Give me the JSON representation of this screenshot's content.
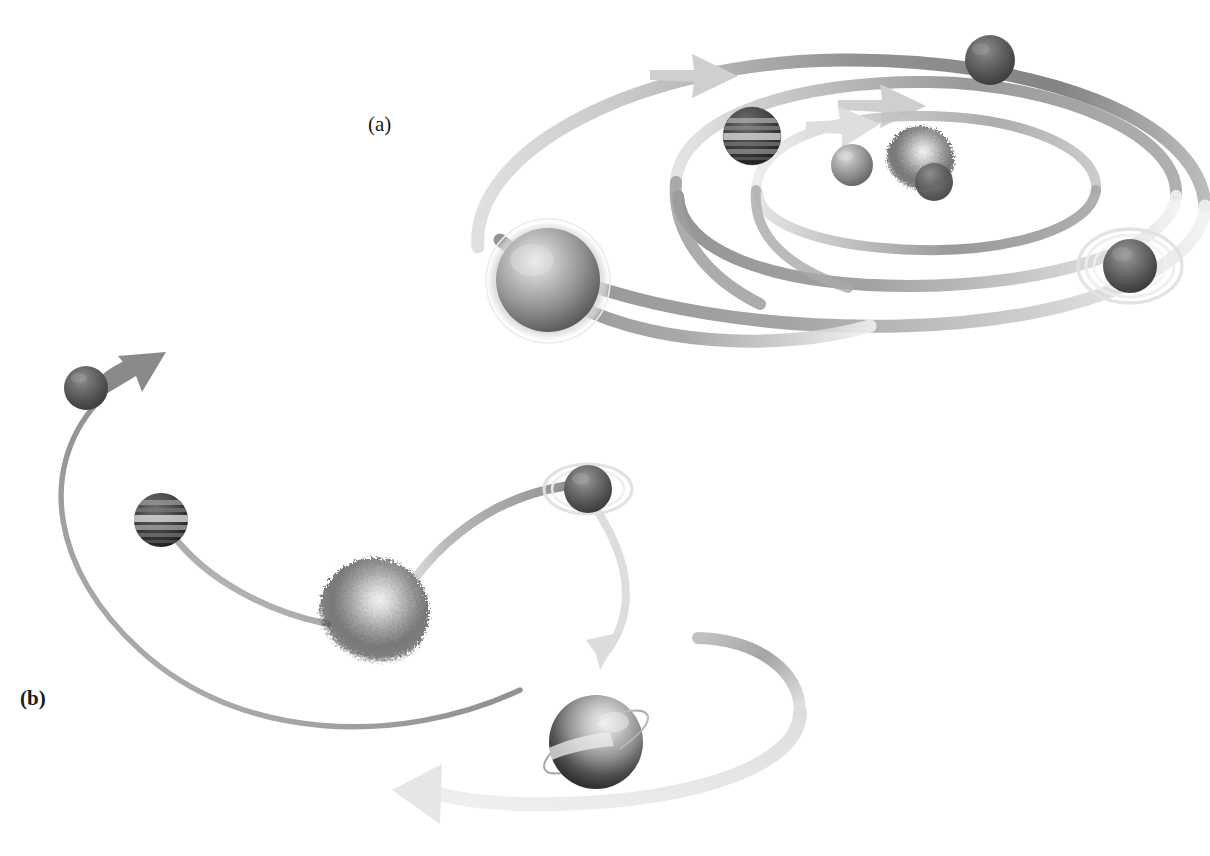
{
  "figure": {
    "background_color": "#ffffff",
    "width": 1210,
    "height": 856,
    "panels": [
      {
        "id": "a",
        "label": "(a)",
        "caption_position": "top-left-of-panel",
        "description": "Coplanar multi-body system: nested elliptical ribbon orbits seen in perspective, all bodies orbiting in the same direction",
        "orbit_count": 3,
        "body_count": 6
      },
      {
        "id": "b",
        "label": "(b)",
        "caption_position": "left-of-panel",
        "description": "Scattered system: bodies on independent open curved trajectories around a diffuse central object",
        "orbit_count": 4,
        "body_count": 4
      }
    ]
  },
  "colors": {
    "background": "#ffffff",
    "orbit_dark": "#7a7a7a",
    "orbit_mid": "#9b9b9b",
    "orbit_light": "#cfcfcf",
    "orbit_pale": "#e6e6e6",
    "arrow_light": "#d4d4d4",
    "arrow_mid": "#a8a8a8",
    "sphere_light": "#d8d8d8",
    "sphere_mid": "#8e8e8e",
    "sphere_dark": "#3a3a3a",
    "sphere_deep": "#1f1f1f",
    "ring_halo": "#e8e8e8",
    "label_text": "#1a1a1a"
  },
  "panel_a": {
    "label": "(a)",
    "orbits": [
      {
        "name": "outer-orbit",
        "cx": 835,
        "cy": 190,
        "rx": 372,
        "ry": 136,
        "tilt": -6,
        "band_width": 13,
        "tone": "orbit_mid",
        "arrow": "right"
      },
      {
        "name": "middle-orbit",
        "cx": 880,
        "cy": 178,
        "rx": 255,
        "ry": 96,
        "tilt": -6,
        "band_width": 12,
        "tone": "orbit_mid",
        "arrow": "right"
      },
      {
        "name": "inner-orbit",
        "cx": 905,
        "cy": 170,
        "rx": 158,
        "ry": 62,
        "tilt": -6,
        "band_width": 10,
        "tone": "orbit_light",
        "arrow": "right"
      }
    ],
    "bodies": [
      {
        "name": "large-gray-sphere",
        "kind": "ringed-halo-sphere",
        "cx": 548,
        "cy": 280,
        "r": 52,
        "surface": "smooth-gradient",
        "has_halo": true
      },
      {
        "name": "banded-gas-giant",
        "kind": "banded-planet",
        "cx": 752,
        "cy": 136,
        "r": 29,
        "surface": "horizontal-bands",
        "has_halo": false
      },
      {
        "name": "small-dark-sphere-top-right",
        "kind": "plain-sphere",
        "cx": 990,
        "cy": 60,
        "r": 25,
        "surface": "mottled",
        "has_halo": false
      },
      {
        "name": "small-gray-sphere-inner",
        "kind": "plain-sphere",
        "cx": 852,
        "cy": 165,
        "r": 21,
        "surface": "smooth-gradient",
        "has_halo": false
      },
      {
        "name": "diffuse-nebular-body",
        "kind": "fuzzy-sphere",
        "cx": 920,
        "cy": 162,
        "r": 34,
        "surface": "grainy-cloud",
        "has_halo": false
      },
      {
        "name": "ringed-planet-right",
        "kind": "ringed-planet",
        "cx": 1130,
        "cy": 266,
        "r": 27,
        "surface": "mottled",
        "has_halo": true
      }
    ]
  },
  "panel_b": {
    "label": "(b)",
    "trajectories": [
      {
        "name": "outer-left-arc",
        "tone": "orbit_mid",
        "band_width": 5,
        "arrow": "up-right",
        "description": "long thin arc sweeping from lower right up to upper left body"
      },
      {
        "name": "inner-left-arc",
        "tone": "orbit_mid",
        "band_width": 6,
        "arrow": "none",
        "description": "arc from centre out to banded planet at mid-left"
      },
      {
        "name": "ringed-planet-arc",
        "tone": "orbit_mid",
        "band_width": 9,
        "arrow": "none",
        "description": "arc running to the ringed planet at upper right"
      },
      {
        "name": "lower-right-sweep",
        "tone": "arrow_light",
        "band_width": 14,
        "arrow": "left",
        "description": "pale wide ribbon curving around the lower-right sphere and exiting left"
      }
    ],
    "bodies": [
      {
        "name": "small-sphere-upper-left",
        "kind": "plain-sphere",
        "cx": 86,
        "cy": 388,
        "r": 22,
        "surface": "mottled",
        "has_halo": false
      },
      {
        "name": "banded-gas-giant-left",
        "kind": "banded-planet",
        "cx": 161,
        "cy": 520,
        "r": 27,
        "surface": "horizontal-bands",
        "has_halo": false
      },
      {
        "name": "ringed-planet-upper-right",
        "kind": "ringed-planet",
        "cx": 588,
        "cy": 489,
        "r": 24,
        "surface": "mottled",
        "has_halo": true
      },
      {
        "name": "diffuse-central-body",
        "kind": "fuzzy-sphere",
        "cx": 374,
        "cy": 613,
        "r": 55,
        "surface": "grainy-cloud",
        "has_halo": false
      },
      {
        "name": "tilted-ring-sphere-lower-right",
        "kind": "axis-ringed-sphere",
        "cx": 596,
        "cy": 742,
        "r": 47,
        "surface": "smooth-gradient",
        "has_halo": false
      }
    ]
  }
}
